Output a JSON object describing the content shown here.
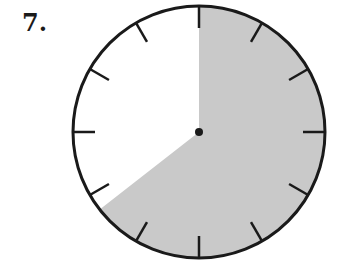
{
  "problem": {
    "number": "7."
  },
  "diagram": {
    "type": "clock-fraction",
    "center": [
      199,
      132
    ],
    "radius": 126,
    "tick_count": 12,
    "shaded_start_deg": 0,
    "shaded_end_deg": 232,
    "shade_color": "#c9c9c9",
    "stroke_color": "#1a1a1a"
  }
}
